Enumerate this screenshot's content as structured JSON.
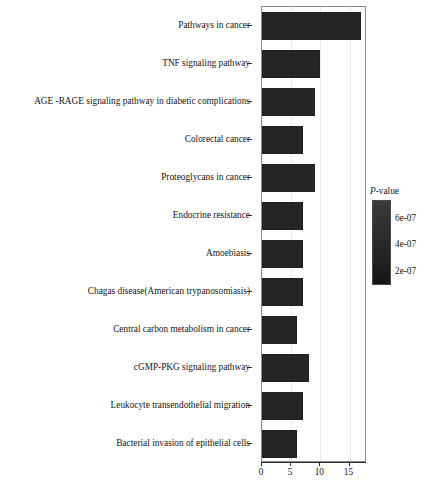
{
  "chart_data": {
    "type": "bar",
    "orientation": "horizontal",
    "title": "",
    "xlabel": "",
    "ylabel": "",
    "xlim": [
      0,
      18
    ],
    "xticks": [
      0,
      5,
      10,
      15
    ],
    "xtick_labels": [
      "0",
      "5",
      "10",
      "15"
    ],
    "grid": true,
    "grid_axis": "x",
    "bar_color": "#262626",
    "categories": [
      "Pathways in cancer",
      "TNF signaling pathway",
      "AGE -RAGE signaling pathway in diabetic complications",
      "Colorectal cancer",
      "Proteoglycans in cancer",
      "Endocrine resistance",
      "Amoebiasis",
      "Chagas disease(American trypanosomiasis)",
      "Central carbon metabolism in cancer",
      "cGMP-PKG signaling pathway",
      "Leukocyte transendothelial migration",
      "Bacterial invasion of epithelial cells"
    ],
    "values": [
      17,
      10,
      9,
      7,
      9,
      7,
      7,
      7,
      6,
      8,
      7,
      6
    ],
    "legend": {
      "title_italic": "P",
      "title_rest": "-value",
      "position": "right",
      "type": "colorbar",
      "ticks": [
        "6e-07",
        "4e-07",
        "2e-07"
      ],
      "tick_values": [
        6e-07,
        4e-07,
        2e-07
      ],
      "gradient_top_color": "#3a3a3a",
      "gradient_bottom_color": "#161616"
    }
  }
}
